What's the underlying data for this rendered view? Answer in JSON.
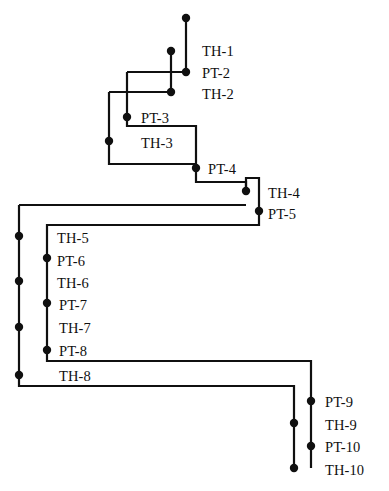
{
  "diagram": {
    "type": "staircase-tree",
    "title": "",
    "canvas": {
      "width": 389,
      "height": 491
    },
    "style": {
      "background": "#ffffff",
      "line_color": "#101010",
      "node_color": "#101010",
      "line_width": 2.2,
      "node_radius": 4.2,
      "label_color": "#101010",
      "label_font_size": 14.5
    },
    "nodes": [
      {
        "id": "TH-1",
        "label": "TH-1",
        "x": 186,
        "y": 18,
        "label_x": 202,
        "label_y": 44
      },
      {
        "id": "PT-2",
        "label": "PT-2",
        "x": 186,
        "y": 72,
        "label_x": 202,
        "label_y": 66
      },
      {
        "id": "TH-2",
        "label": "TH-2",
        "x": 171,
        "y": 92,
        "label_x": 202,
        "label_y": 87
      },
      {
        "id": "TH-2b",
        "label": "",
        "x": 171,
        "y": 51,
        "label_x": 0,
        "label_y": 0
      },
      {
        "id": "PT-3",
        "label": "PT-3",
        "x": 127,
        "y": 117,
        "label_x": 141,
        "label_y": 111
      },
      {
        "id": "TH-3",
        "label": "TH-3",
        "x": 109,
        "y": 141,
        "label_x": 141,
        "label_y": 136
      },
      {
        "id": "PT-4",
        "label": "PT-4",
        "x": 196,
        "y": 168,
        "label_x": 208,
        "label_y": 162
      },
      {
        "id": "TH-4",
        "label": "TH-4",
        "x": 246,
        "y": 191,
        "label_x": 268,
        "label_y": 186
      },
      {
        "id": "PT-5",
        "label": "PT-5",
        "x": 259,
        "y": 211,
        "label_x": 268,
        "label_y": 207
      },
      {
        "id": "TH-5",
        "label": "TH-5",
        "x": 19,
        "y": 236,
        "label_x": 57,
        "label_y": 231
      },
      {
        "id": "PT-6",
        "label": "PT-6",
        "x": 47,
        "y": 258,
        "label_x": 57,
        "label_y": 254
      },
      {
        "id": "TH-6",
        "label": "TH-6",
        "x": 19,
        "y": 281,
        "label_x": 57,
        "label_y": 276
      },
      {
        "id": "PT-7",
        "label": "PT-7",
        "x": 47,
        "y": 303,
        "label_x": 59,
        "label_y": 298
      },
      {
        "id": "TH-7",
        "label": "TH-7",
        "x": 19,
        "y": 327,
        "label_x": 59,
        "label_y": 321
      },
      {
        "id": "PT-8",
        "label": "PT-8",
        "x": 47,
        "y": 350,
        "label_x": 59,
        "label_y": 344
      },
      {
        "id": "TH-8",
        "label": "TH-8",
        "x": 19,
        "y": 375,
        "label_x": 59,
        "label_y": 369
      },
      {
        "id": "PT-9",
        "label": "PT-9",
        "x": 311,
        "y": 401,
        "label_x": 325,
        "label_y": 395
      },
      {
        "id": "TH-9",
        "label": "TH-9",
        "x": 294,
        "y": 423,
        "label_x": 325,
        "label_y": 418
      },
      {
        "id": "PT-10",
        "label": "PT-10",
        "x": 311,
        "y": 446,
        "label_x": 325,
        "label_y": 440
      },
      {
        "id": "TH-10",
        "label": "TH-10",
        "x": 294,
        "y": 468,
        "label_x": 325,
        "label_y": 463
      }
    ],
    "polylines": [
      "M186,18 L186,72",
      "M171,51 L171,92",
      "M127,72 L186,72",
      "M127,72 L127,117",
      "M109,92 L171,92",
      "M109,92 L109,141",
      "M127,117 L127,126 L196,126 L196,168",
      "M109,141 L109,164 L196,164",
      "M196,168 L196,182 L246,182 L246,191",
      "M246,191 L246,178 L259,178 L259,211",
      "M259,211 L259,225 L47,225 L47,350",
      "M19,205 L19,375",
      "M19,205 L246,205",
      "M47,350 L47,361 L311,361 L311,468",
      "M19,375 L19,386 L294,386 L294,468"
    ],
    "labels_note": "Node identifiers of the ladder diagram"
  }
}
